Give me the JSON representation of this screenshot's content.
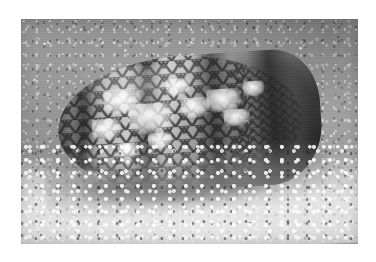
{
  "page": {
    "background_color": "#ffffff",
    "width": 376,
    "height": 262
  },
  "photo": {
    "name": "cone-snail-photograph",
    "subject": "Textile cone snail shell",
    "scene": "Cone snail shell resting on coarse coral sand seabed",
    "color_mode": "grayscale",
    "frame": {
      "left": 21,
      "top": 19,
      "width": 337,
      "height": 225,
      "border_color": "#ffffff"
    },
    "palette": {
      "sand_light": "#c6c6c6",
      "sand_mid": "#a6a6a6",
      "sand_dark": "#8e8e8e",
      "shell_light": "#cfcfcf",
      "shell_mid": "#8d8d8d",
      "shell_dark": "#2b2b2b",
      "shadow": "#1a1a1a",
      "highlight": "#ffffff"
    },
    "subject_elements": [
      {
        "name": "shell-spire",
        "description": "Broad rounded shoulder at left end of the cone shell"
      },
      {
        "name": "shell-body-whorl",
        "description": "Main conical body with reticulated tent pattern"
      },
      {
        "name": "shell-siphonal-end",
        "description": "Narrow tapering dark tip at right"
      },
      {
        "name": "shell-aperture-lip",
        "description": "Pale aperture lip visible at lower left"
      },
      {
        "name": "tent-pattern",
        "description": "Network of dark lines enclosing white triangular tent markings"
      },
      {
        "name": "axial-bands",
        "description": "Four darker vertical bands crossing the shell"
      },
      {
        "name": "cast-shadow",
        "description": "Dark shadow cast beneath the shell onto the sand"
      },
      {
        "name": "sand-substrate",
        "description": "Granular coral sand covering the whole background"
      },
      {
        "name": "foreground-rubble",
        "description": "Brighter coarse sand grains in the lower foreground"
      }
    ],
    "tent_blotches": [
      {
        "left": "18%",
        "top": "22%",
        "width": "14%",
        "height": "19%"
      },
      {
        "left": "27%",
        "top": "34%",
        "width": "17%",
        "height": "22%"
      },
      {
        "left": "13%",
        "top": "44%",
        "width": "11%",
        "height": "15%"
      },
      {
        "left": "42%",
        "top": "17%",
        "width": "9%",
        "height": "13%"
      },
      {
        "left": "47%",
        "top": "32%",
        "width": "11%",
        "height": "15%"
      },
      {
        "left": "57%",
        "top": "27%",
        "width": "13%",
        "height": "17%"
      },
      {
        "left": "63%",
        "top": "42%",
        "width": "10%",
        "height": "13%"
      },
      {
        "left": "34%",
        "top": "56%",
        "width": "9%",
        "height": "12%"
      },
      {
        "left": "22%",
        "top": "62%",
        "width": "8%",
        "height": "11%"
      },
      {
        "left": "71%",
        "top": "22%",
        "width": "8%",
        "height": "11%"
      }
    ]
  }
}
